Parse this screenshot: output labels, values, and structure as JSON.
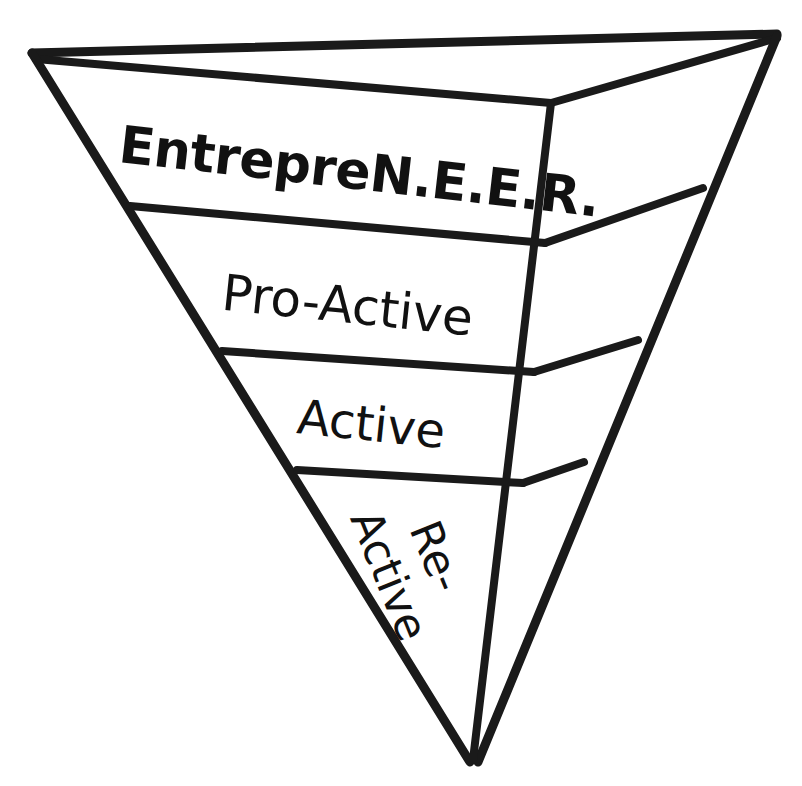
{
  "diagram": {
    "type": "inverted-3d-pyramid",
    "background_color": "#ffffff",
    "line_color": "#1a1a1a",
    "face_color": "#ffffff",
    "tiers": [
      {
        "id": "tier-1",
        "label": "EntrepreN.E.E.R.",
        "level": 1,
        "position": "top",
        "weight": "bold",
        "rotation_deg": 6.5
      },
      {
        "id": "tier-2",
        "label": "Pro-Active",
        "level": 2,
        "position": "upper-middle",
        "weight": "regular",
        "rotation_deg": 6.0
      },
      {
        "id": "tier-3",
        "label": "Active",
        "level": 3,
        "position": "lower-middle",
        "weight": "regular",
        "rotation_deg": 6.0
      },
      {
        "id": "tier-4",
        "label_line1": "Re-",
        "label_line2": "Active",
        "level": 4,
        "position": "bottom-apex",
        "weight": "regular",
        "rotation_deg": 68
      }
    ]
  }
}
